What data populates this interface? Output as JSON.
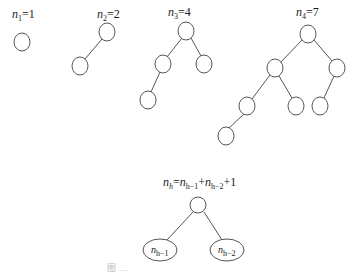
{
  "trees": [
    {
      "label_var": "n",
      "label_sub": "1",
      "label_val": "=1"
    },
    {
      "label_var": "n",
      "label_sub": "2",
      "label_val": "=2"
    },
    {
      "label_var": "n",
      "label_sub": "3",
      "label_val": "=4"
    },
    {
      "label_var": "n",
      "label_sub": "4",
      "label_val": "=7"
    }
  ],
  "recurrence": {
    "lhs_var": "n",
    "lhs_sub": "h",
    "eq": "=",
    "t1_var": "n",
    "t1_sub": "h−1",
    "plus1": "+",
    "t2_var": "n",
    "t2_sub": "h−2",
    "plus2": "+1",
    "left_subtree_var": "n",
    "left_subtree_sub": "h−1",
    "right_subtree_var": "n",
    "right_subtree_sub": "h−2"
  },
  "caption": "图 …"
}
